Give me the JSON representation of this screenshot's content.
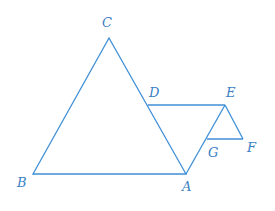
{
  "diagram": {
    "color": "#3f8fd6",
    "label_color": "#3a7fc4",
    "points": {
      "C": {
        "label": "C",
        "x": 109,
        "y": 38
      },
      "B": {
        "label": "B",
        "x": 33,
        "y": 174
      },
      "A": {
        "label": "A",
        "x": 186,
        "y": 174
      },
      "D": {
        "label": "D",
        "x": 148,
        "y": 105
      },
      "E": {
        "label": "E",
        "x": 225,
        "y": 105
      },
      "G": {
        "label": "G",
        "x": 207,
        "y": 139
      },
      "F": {
        "label": "F",
        "x": 243,
        "y": 139
      }
    },
    "segments": [
      "CB",
      "BA",
      "AC",
      "DE",
      "EA",
      "EF",
      "FG"
    ],
    "labels": {
      "C": "C",
      "B": "B",
      "A": "A",
      "D": "D",
      "E": "E",
      "G": "G",
      "F": "F"
    }
  }
}
